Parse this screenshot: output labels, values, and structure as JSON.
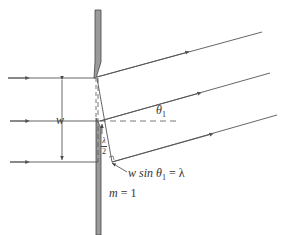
{
  "figure": {
    "type": "single-slit diffraction diagram",
    "labels": {
      "slit_width": "w",
      "angle": "θ",
      "angle_subscript": "1",
      "half_lambda_num": "λ",
      "half_lambda_den": "2",
      "path_difference": "w sin θ",
      "path_difference_subscript": "1",
      "path_difference_rhs": " = λ",
      "order_var": "m",
      "order_value": " = 1"
    },
    "colors": {
      "line": "#555555",
      "barrier_fill": "#9a9a9a",
      "barrier_stroke": "#444444",
      "background": "#ffffff"
    },
    "incoming_rays": 3,
    "outgoing_rays": 3
  }
}
